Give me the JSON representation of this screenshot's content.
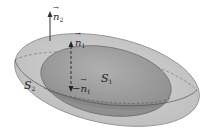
{
  "diagram": {
    "surfaces": [
      {
        "id": "S2",
        "label": "S",
        "subscript": "2",
        "role": "outer closed surface",
        "fill": "#c8c8c8"
      },
      {
        "id": "S1",
        "label": "S",
        "subscript": "1",
        "role": "inner closed surface",
        "fill": "#9a9a9a"
      }
    ],
    "vectors": [
      {
        "id": "n2",
        "symbol": "n",
        "subscript": "2",
        "prefix": "",
        "direction": "up",
        "style": "solid"
      },
      {
        "id": "n1",
        "symbol": "n",
        "subscript": "1",
        "prefix": "",
        "direction": "up",
        "style": "dashed"
      },
      {
        "id": "neg_n1",
        "symbol": "n",
        "subscript": "1",
        "prefix": "−",
        "direction": "down",
        "style": "dashed"
      }
    ],
    "colors": {
      "outer_fill": "#c9c9c9",
      "inner_fill": "#9c9c9c",
      "stroke": "#555555",
      "arrow": "#333333"
    }
  }
}
